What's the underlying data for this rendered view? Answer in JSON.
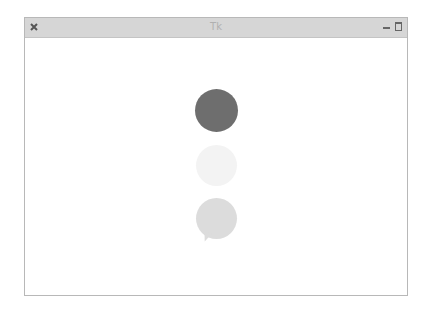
{
  "window": {
    "title": "Tk",
    "controls": {
      "close_icon": "close-icon",
      "minimize_icon": "minimize-icon",
      "maximize_icon": "maximize-icon"
    }
  },
  "canvas": {
    "shapes": [
      {
        "type": "circle",
        "color": "#6e6e6e",
        "cx": 216,
        "cy": 110,
        "diameter": 43
      },
      {
        "type": "circle",
        "color": "#f3f3f3",
        "cx": 216,
        "cy": 165,
        "diameter": 41
      },
      {
        "type": "speech-bubble",
        "color": "#dcdcdc",
        "cx": 216,
        "cy": 218,
        "diameter": 41
      }
    ]
  },
  "colors": {
    "titlebar": "#d6d6d6",
    "window_border": "#b8b8b8",
    "background": "#ffffff"
  }
}
